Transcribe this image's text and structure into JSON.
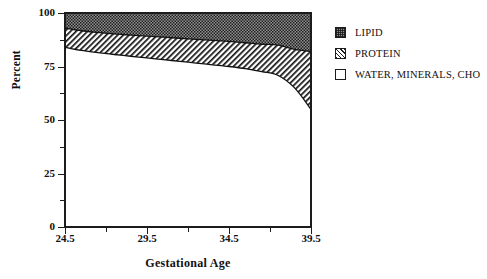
{
  "chart_data": {
    "type": "area",
    "stacked": true,
    "title": "",
    "subtitle": "",
    "xlabel": "Gestational Age",
    "ylabel": "Percent",
    "xlim": [
      24.5,
      39.5
    ],
    "ylim": [
      0,
      100
    ],
    "grid": false,
    "legend_position": "right",
    "x_ticks": [
      "24.5",
      "29.5",
      "34.5",
      "39.5"
    ],
    "x_tick_values": [
      24.5,
      29.5,
      34.5,
      39.5
    ],
    "x_minor_tick_values": [
      27.0,
      32.0,
      37.0
    ],
    "y_ticks": [
      "0",
      "25",
      "50",
      "75",
      "100"
    ],
    "y_tick_values": [
      0,
      25,
      50,
      75,
      100
    ],
    "y_minor_tick_values": [
      12.5,
      37.5,
      62.5,
      87.5
    ],
    "x": [
      24.5,
      25.5,
      26.5,
      27.5,
      28.5,
      29.5,
      30.5,
      31.5,
      32.5,
      33.5,
      34.5,
      35.5,
      36.5,
      37.5,
      38.5,
      39.5
    ],
    "series": [
      {
        "name": "WATER, MINERALS, CHO",
        "fill": "white",
        "values": [
          84.0,
          82.5,
          81.5,
          80.6,
          79.8,
          79.0,
          78.2,
          77.4,
          76.6,
          75.8,
          75.0,
          74.0,
          72.6,
          70.8,
          65.0,
          55.0
        ]
      },
      {
        "name": "PROTEIN",
        "fill": "diagonal-hatch",
        "values": [
          9.0,
          9.2,
          9.4,
          9.6,
          9.9,
          10.2,
          10.5,
          10.8,
          11.1,
          11.4,
          11.7,
          12.1,
          12.8,
          14.2,
          18.0,
          27.0
        ]
      },
      {
        "name": "LIPID",
        "fill": "stipple-gray",
        "values": [
          7.0,
          8.3,
          9.1,
          9.8,
          10.3,
          10.8,
          11.3,
          11.8,
          12.3,
          12.8,
          13.3,
          13.9,
          14.6,
          15.0,
          17.0,
          18.0
        ]
      }
    ],
    "boundary_upper_protein_lipid": [
      93.0,
      91.7,
      90.9,
      90.2,
      89.7,
      89.2,
      88.7,
      88.2,
      87.7,
      87.2,
      86.7,
      86.1,
      85.4,
      85.0,
      83.0,
      82.0
    ],
    "boundary_water_protein": [
      84.0,
      82.5,
      81.5,
      80.6,
      79.8,
      79.0,
      78.2,
      77.4,
      76.6,
      75.8,
      75.0,
      74.0,
      72.6,
      70.8,
      65.0,
      55.0
    ]
  },
  "legend": {
    "items": [
      {
        "label": "LIPID",
        "swatch": "stipple-gray-swatch"
      },
      {
        "label": "PROTEIN",
        "swatch": "diagonal-hatch-swatch"
      },
      {
        "label": "WATER, MINERALS, CHO",
        "swatch": "white-swatch"
      }
    ]
  },
  "axes": {
    "y_title": "Percent",
    "x_title": "Gestational Age"
  }
}
